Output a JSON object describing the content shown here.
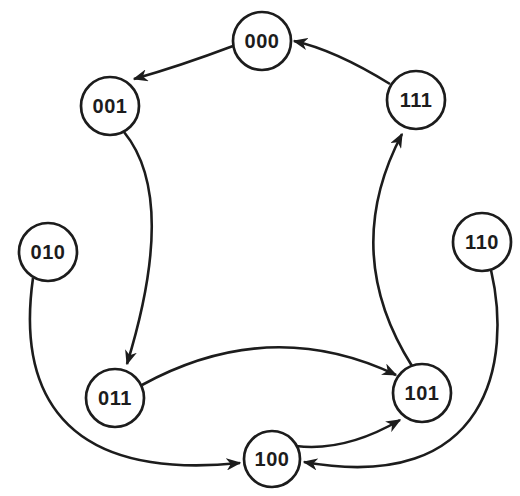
{
  "diagram": {
    "type": "state-transition-diagram",
    "colors": {
      "ink": "#1c1c1c",
      "paper": "#ffffff"
    },
    "nodes": [
      {
        "id": "000",
        "label": "000",
        "x": 262,
        "y": 41,
        "r": 29
      },
      {
        "id": "001",
        "label": "001",
        "x": 110,
        "y": 106,
        "r": 29
      },
      {
        "id": "010",
        "label": "010",
        "x": 48,
        "y": 252,
        "r": 29
      },
      {
        "id": "011",
        "label": "011",
        "x": 115,
        "y": 398,
        "r": 29
      },
      {
        "id": "100",
        "label": "100",
        "x": 272,
        "y": 459,
        "r": 28
      },
      {
        "id": "101",
        "label": "101",
        "x": 422,
        "y": 393,
        "r": 29
      },
      {
        "id": "110",
        "label": "110",
        "x": 482,
        "y": 242,
        "r": 29
      },
      {
        "id": "111",
        "label": "111",
        "x": 416,
        "y": 100,
        "r": 29
      }
    ],
    "edges": [
      {
        "from": "000",
        "to": "001",
        "path": "M 233,46 Q 180,66 134,79"
      },
      {
        "from": "111",
        "to": "000",
        "path": "M 390,84 Q 335,50 294,41"
      },
      {
        "from": "001",
        "to": "011",
        "path": "M 124,132 Q 178,198 127,364"
      },
      {
        "from": "011",
        "to": "101",
        "path": "M 142,385 Q 270,315 396,375"
      },
      {
        "from": "101",
        "to": "111",
        "path": "M 412,366 Q 340,252 402,134"
      },
      {
        "from": "010",
        "to": "100",
        "path": "M 33,278 C 20,370 42,483 240,463"
      },
      {
        "from": "110",
        "to": "100",
        "path": "M 491,270 C 512,360 490,495 304,462"
      },
      {
        "from": "100",
        "to": "101",
        "path": "M 296,446 Q 345,452 400,420"
      }
    ]
  }
}
